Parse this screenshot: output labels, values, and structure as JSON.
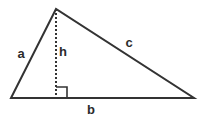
{
  "figure": {
    "name": "triangle-with-altitude",
    "background_color": "#ffffff",
    "stroke_color": "#333333",
    "label_color": "#2b2b2b",
    "width": 203,
    "height": 122
  },
  "geometry": {
    "apex": {
      "x": 56,
      "y": 9
    },
    "left_vertex": {
      "x": 11,
      "y": 98
    },
    "right_vertex": {
      "x": 194,
      "y": 98
    },
    "altitude_foot": {
      "x": 56,
      "y": 98
    },
    "right_angle_marker": {
      "x": 56,
      "y": 87,
      "size": 11
    },
    "altitude_dash_pattern": "2 2"
  },
  "labels": {
    "side_a": {
      "text": "a",
      "x": 21,
      "y": 53
    },
    "altitude_h": {
      "text": "h",
      "x": 63,
      "y": 51
    },
    "side_c": {
      "text": "c",
      "x": 129,
      "y": 42
    },
    "side_b": {
      "text": "b",
      "x": 91,
      "y": 109
    }
  }
}
